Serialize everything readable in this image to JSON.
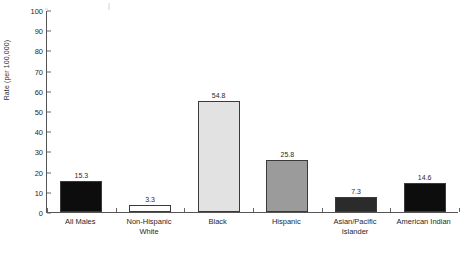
{
  "chart_data": {
    "type": "bar",
    "title": "",
    "subtitle": "",
    "xlabel": "",
    "ylabel": "Rate (per 100,000)",
    "ylim": [
      0,
      100
    ],
    "ytick_step": 10,
    "yticks": [
      "100",
      "90",
      "80",
      "70",
      "60",
      "50",
      "40",
      "30",
      "20",
      "10",
      "0"
    ],
    "grid": false,
    "legend": false,
    "legend_position": "none",
    "categories": [
      "All Males",
      "Non-Hispanic White",
      "Black",
      "Hispanic",
      "Asian/Pacific Islander",
      "American Indian"
    ],
    "category_lines": [
      [
        "All Males",
        ""
      ],
      [
        "Non-Hispanic",
        "White"
      ],
      [
        "Black",
        ""
      ],
      [
        "Hispanic",
        ""
      ],
      [
        "Asian/Pacific",
        "Islander"
      ],
      [
        "American Indian",
        ""
      ]
    ],
    "values": [
      15.3,
      3.3,
      54.8,
      25.8,
      7.3,
      14.6
    ],
    "value_labels": [
      "15.3",
      "3.3",
      "54.8",
      "25.8",
      "7.3",
      "14.6"
    ],
    "bar_colors": [
      "#0d0d0d",
      "#ffffff",
      "#e2e2e2",
      "#9b9b9b",
      "#2b2b2b",
      "#0d0d0d"
    ],
    "bar_edge_color": "#3a3a3a",
    "axis_color": "#555555",
    "text_color": "#1f1f1f"
  },
  "caption": {
    "text": ""
  }
}
